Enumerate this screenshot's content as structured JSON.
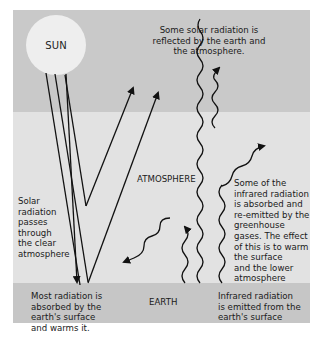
{
  "diagram": {
    "colors": {
      "space": "#c9c9c9",
      "atmosphere": "#e2e2e2",
      "earth": "#c6c6c6",
      "sun": "#eeeeee",
      "arrow": "#111111",
      "text": "#1a1a1a"
    },
    "labels": {
      "sun": "SUN",
      "atmosphere": "ATMOSPHERE",
      "earth": "EARTH"
    },
    "annotations": {
      "reflected": "Some solar radiation is reflected by the earth and the atmosphere.",
      "passes_through": "Solar radiation passes through the clear atmosphere",
      "absorbed_surface": "Most radiation is absorbed by the earth's surface and warms it.",
      "reemitted": "Some of the infrared radiation is absorbed and re-emitted by the greenhouse gases. The effect of this is to warm the surface and the lower atmosphere",
      "infrared_emitted": "Infrared radiation is emitted from the earth's surface"
    },
    "annotation_lines": {
      "reflected": [
        "Some solar radiation is",
        "reflected by the earth and",
        "the atmosphere."
      ],
      "passes_through": [
        "Solar",
        "radiation",
        "passes",
        "through",
        "the clear",
        "atmosphere"
      ],
      "absorbed_surface": [
        "Most radiation is",
        "absorbed by the",
        "earth's surface",
        "and warms it."
      ],
      "reemitted": [
        "Some of the",
        "infrared radiation",
        "is absorbed and",
        "re-emitted by the",
        "greenhouse",
        "gases. The effect",
        "of this is to warm",
        "the surface",
        "and the lower",
        "atmosphere"
      ],
      "infrared_emitted": [
        "Infrared radiation",
        "is emitted from the",
        "earth's surface"
      ]
    }
  }
}
